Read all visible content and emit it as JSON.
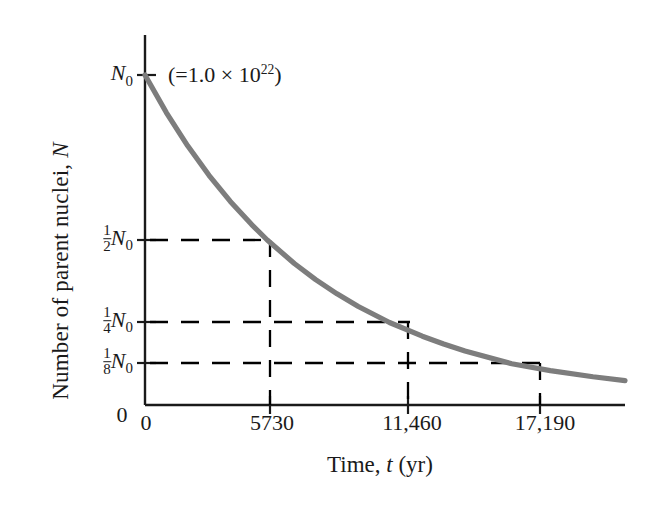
{
  "chart_data": {
    "type": "line",
    "title": "",
    "xlabel": "Time, t  (yr)",
    "ylabel": "Number of parent nuclei, N",
    "x_tick_labels": [
      "0",
      "5730",
      "11,460",
      "17,190"
    ],
    "x_tick_values": [
      0,
      5730,
      11460,
      17190
    ],
    "y_tick_labels": [
      "1/2 N0",
      "1/4 N0",
      "1/8 N0"
    ],
    "y_tick_fractions": [
      {
        "numerator": "1",
        "denominator": "2",
        "symbol": "N",
        "subscript": "0"
      },
      {
        "numerator": "1",
        "denominator": "4",
        "symbol": "N",
        "subscript": "0"
      },
      {
        "numerator": "1",
        "denominator": "8",
        "symbol": "N",
        "subscript": "0"
      }
    ],
    "y_tick_values": [
      0.5,
      0.25,
      0.125
    ],
    "origin_label": "0",
    "y_top_label": "N0",
    "annotation": "(=1.0 × 10^22)",
    "xlim": [
      0,
      22500
    ],
    "ylim": [
      0,
      1.0
    ],
    "grid": false,
    "legend": "none",
    "half_life": 5730,
    "half_life_units": "yr",
    "initial_value": 1.0,
    "initial_value_exponent": 22,
    "series": [
      {
        "name": "Exponential decay of parent nuclei",
        "color": "#7d7d7d",
        "x": [
          0,
          1000,
          2000,
          3000,
          4000,
          5000,
          5730,
          7000,
          8000,
          9000,
          10000,
          11460,
          13000,
          14000,
          15000,
          17190,
          19000,
          21000,
          22500
        ],
        "y": [
          1.0,
          0.8862,
          0.7854,
          0.696,
          0.6169,
          0.5467,
          0.5,
          0.4288,
          0.38,
          0.3368,
          0.2985,
          0.25,
          0.2085,
          0.1848,
          0.1638,
          0.125,
          0.1043,
          0.0855,
          0.074
        ]
      }
    ],
    "guide_lines": [
      {
        "name": "half-life-1",
        "y_value": 0.5,
        "x_value": 5730,
        "style": "dashed",
        "color": "#000000"
      },
      {
        "name": "half-life-2",
        "y_value": 0.25,
        "x_value": 11460,
        "style": "dashed",
        "color": "#000000"
      },
      {
        "name": "half-life-3",
        "y_value": 0.125,
        "x_value": 17190,
        "style": "dashed",
        "color": "#000000"
      }
    ]
  },
  "labels": {
    "y_axis_title_text": "Number of parent nuclei,",
    "y_axis_title_symbol": "N",
    "x_axis_title_text": "Time,",
    "x_axis_title_symbol": "t",
    "x_axis_title_units": "(yr)",
    "origin": "0",
    "n0_symbol": "N",
    "n0_subscript": "0",
    "annotation_open": "(=1.0",
    "annotation_times": "×",
    "annotation_base": "10",
    "annotation_exponent": "22",
    "annotation_close": ")",
    "x_ticks": [
      "0",
      "5730",
      "11,460",
      "17,190"
    ],
    "y_fractions": [
      {
        "num": "1",
        "den": "2"
      },
      {
        "num": "1",
        "den": "4"
      },
      {
        "num": "1",
        "den": "8"
      }
    ]
  },
  "colors": {
    "curve": "#7d7d7d",
    "axis": "#1a1a1a",
    "guide": "#000000",
    "background": "#ffffff",
    "text": "#1a1a1a"
  }
}
